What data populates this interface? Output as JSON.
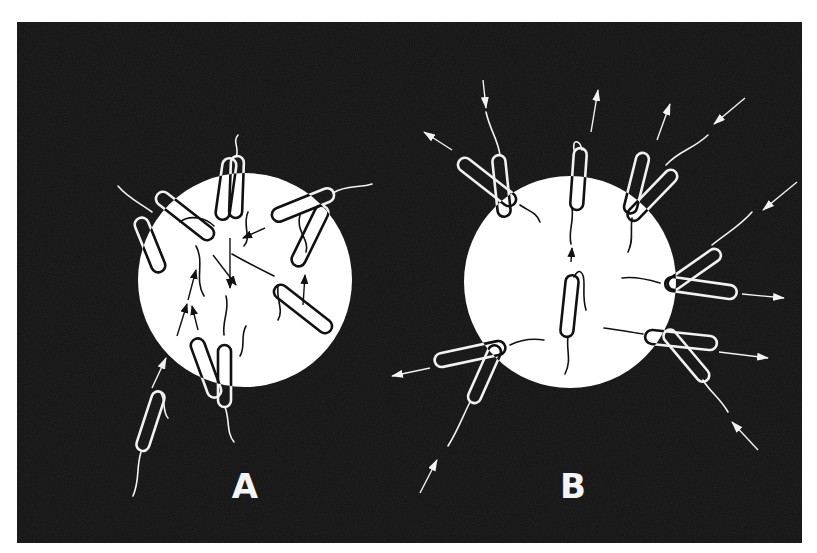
{
  "figure": {
    "background": "#121212",
    "frame": {
      "x": 17,
      "y": 22,
      "width": 785,
      "height": 521
    },
    "panels": [
      {
        "id": "A",
        "label": "A",
        "label_pos": [
          245,
          498
        ],
        "circle": {
          "cx": 245,
          "cy": 280,
          "r": 107,
          "fill": "#ffffff"
        },
        "description": "Cells swim into the spot and accumulate (inward arrows)"
      },
      {
        "id": "B",
        "label": "B",
        "label_pos": [
          573,
          498
        ],
        "circle": {
          "cx": 570,
          "cy": 282,
          "r": 106,
          "fill": "#ffffff"
        },
        "description": "Cells tumble at the edge and swim away (outward arrows)"
      }
    ],
    "colors": {
      "dark": "#121212",
      "light": "#ffffff",
      "outline_on_dark": "#f2f2f2",
      "outline_on_light": "#111111"
    }
  }
}
